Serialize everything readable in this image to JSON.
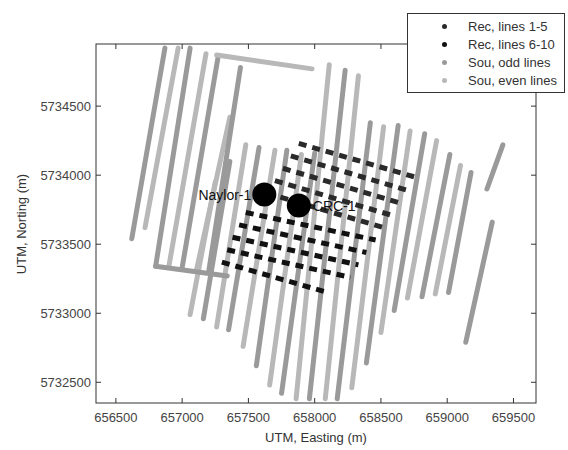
{
  "chart_data": {
    "type": "scatter",
    "title": "",
    "xlabel": "UTM, Easting (m)",
    "ylabel": "UTM, Norting (m)",
    "xlim": [
      656350,
      659670
    ],
    "ylim": [
      5732350,
      5734950
    ],
    "xticks": [
      656500,
      657000,
      657500,
      658000,
      658500,
      659000,
      659500
    ],
    "xtick_labels": [
      "656500",
      "657000",
      "657500",
      "658000",
      "658500",
      "659000",
      "659500"
    ],
    "yticks": [
      5732500,
      5733000,
      5733500,
      5734000,
      5734500
    ],
    "ytick_labels": [
      "5732500",
      "5733000",
      "5733500",
      "5734000",
      "5734500"
    ],
    "grid": false,
    "legend_position": "upper right (outside top edge)",
    "colors": {
      "rec_lines_1_5": "#2a2a2a",
      "rec_lines_6_10": "#111111",
      "sou_odd": "#9a9a9a",
      "sou_even": "#b8b8b8",
      "wells": "#000000"
    },
    "legend": [
      {
        "label": "Rec, lines 1-5",
        "color": "#2a2a2a"
      },
      {
        "label": "Rec, lines 6-10",
        "color": "#111111"
      },
      {
        "label": "Sou, odd lines",
        "color": "#9a9a9a"
      },
      {
        "label": "Sou, even lines",
        "color": "#b8b8b8"
      }
    ],
    "wells": [
      {
        "name": "Naylor-1",
        "x": 657620,
        "y": 5733860
      },
      {
        "name": "CRC-1",
        "x": 657880,
        "y": 5733780
      }
    ],
    "source_lines": [
      {
        "parity": "odd",
        "x1": 656620,
        "y1": 5733540,
        "x2": 656870,
        "y2": 5734920
      },
      {
        "parity": "even",
        "x1": 656720,
        "y1": 5733620,
        "x2": 656970,
        "y2": 5734920
      },
      {
        "parity": "odd",
        "x1": 656800,
        "y1": 5733340,
        "x2": 657060,
        "y2": 5734920
      },
      {
        "parity": "even",
        "x1": 656900,
        "y1": 5733340,
        "x2": 657180,
        "y2": 5734880
      },
      {
        "parity": "odd",
        "x1": 657000,
        "y1": 5733330,
        "x2": 657270,
        "y2": 5734850
      },
      {
        "parity": "even",
        "x1": 657110,
        "y1": 5733320,
        "x2": 657360,
        "y2": 5734420
      },
      {
        "parity": "odd",
        "x1": 657200,
        "y1": 5733300,
        "x2": 657440,
        "y2": 5734780
      },
      {
        "parity": "even",
        "x1": 657060,
        "y1": 5732990,
        "x2": 657250,
        "y2": 5733950
      },
      {
        "parity": "odd",
        "x1": 657160,
        "y1": 5732960,
        "x2": 657360,
        "y2": 5734100
      },
      {
        "parity": "even",
        "x1": 657260,
        "y1": 5732900,
        "x2": 657480,
        "y2": 5734220
      },
      {
        "parity": "odd",
        "x1": 657350,
        "y1": 5732880,
        "x2": 657580,
        "y2": 5734200
      },
      {
        "parity": "even",
        "x1": 657460,
        "y1": 5732760,
        "x2": 657700,
        "y2": 5734180
      },
      {
        "parity": "odd",
        "x1": 657560,
        "y1": 5732620,
        "x2": 657790,
        "y2": 5734180
      },
      {
        "parity": "even",
        "x1": 657660,
        "y1": 5732480,
        "x2": 657900,
        "y2": 5734150
      },
      {
        "parity": "odd",
        "x1": 657750,
        "y1": 5732420,
        "x2": 658000,
        "y2": 5734160
      },
      {
        "parity": "even",
        "x1": 657860,
        "y1": 5732380,
        "x2": 658110,
        "y2": 5734800
      },
      {
        "parity": "odd",
        "x1": 657960,
        "y1": 5732380,
        "x2": 658230,
        "y2": 5734760
      },
      {
        "parity": "even",
        "x1": 658080,
        "y1": 5732380,
        "x2": 658330,
        "y2": 5734720
      },
      {
        "parity": "odd",
        "x1": 658170,
        "y1": 5732380,
        "x2": 658420,
        "y2": 5734380
      },
      {
        "parity": "even",
        "x1": 658280,
        "y1": 5732460,
        "x2": 658520,
        "y2": 5734350
      },
      {
        "parity": "odd",
        "x1": 658390,
        "y1": 5732640,
        "x2": 658630,
        "y2": 5734360
      },
      {
        "parity": "even",
        "x1": 658500,
        "y1": 5732860,
        "x2": 658720,
        "y2": 5734320
      },
      {
        "parity": "odd",
        "x1": 658600,
        "y1": 5733020,
        "x2": 658830,
        "y2": 5734300
      },
      {
        "parity": "even",
        "x1": 658700,
        "y1": 5733110,
        "x2": 658920,
        "y2": 5734250
      },
      {
        "parity": "odd",
        "x1": 658810,
        "y1": 5733120,
        "x2": 659020,
        "y2": 5734150
      },
      {
        "parity": "even",
        "x1": 658910,
        "y1": 5733140,
        "x2": 659100,
        "y2": 5734070
      },
      {
        "parity": "odd",
        "x1": 659010,
        "y1": 5733150,
        "x2": 659180,
        "y2": 5734020
      },
      {
        "parity": "odd",
        "x1": 659140,
        "y1": 5732790,
        "x2": 659340,
        "y2": 5733660
      },
      {
        "parity": "odd",
        "x1": 659300,
        "y1": 5733900,
        "x2": 659420,
        "y2": 5734220
      }
    ],
    "source_crossline": [
      {
        "parity": "even",
        "x1": 657260,
        "y1": 5734870,
        "x2": 657980,
        "y2": 5734770
      },
      {
        "parity": "odd",
        "x1": 656800,
        "y1": 5733340,
        "x2": 657340,
        "y2": 5733270
      }
    ],
    "receiver_lines": [
      {
        "group": "1-5",
        "x1": 657880,
        "y1": 5734230,
        "x2": 658780,
        "y2": 5733980
      },
      {
        "group": "1-5",
        "x1": 657820,
        "y1": 5734140,
        "x2": 658700,
        "y2": 5733890
      },
      {
        "group": "1-5",
        "x1": 657760,
        "y1": 5734050,
        "x2": 658640,
        "y2": 5733800
      },
      {
        "group": "1-5",
        "x1": 657700,
        "y1": 5733960,
        "x2": 658580,
        "y2": 5733710
      },
      {
        "group": "1-5",
        "x1": 657640,
        "y1": 5733870,
        "x2": 658520,
        "y2": 5733620
      },
      {
        "group": "6-10",
        "x1": 657480,
        "y1": 5733730,
        "x2": 658460,
        "y2": 5733530
      },
      {
        "group": "6-10",
        "x1": 657430,
        "y1": 5733640,
        "x2": 658390,
        "y2": 5733440
      },
      {
        "group": "6-10",
        "x1": 657380,
        "y1": 5733550,
        "x2": 658330,
        "y2": 5733350
      },
      {
        "group": "6-10",
        "x1": 657340,
        "y1": 5733460,
        "x2": 658270,
        "y2": 5733260
      },
      {
        "group": "6-10",
        "x1": 657300,
        "y1": 5733370,
        "x2": 658100,
        "y2": 5733150
      }
    ]
  }
}
